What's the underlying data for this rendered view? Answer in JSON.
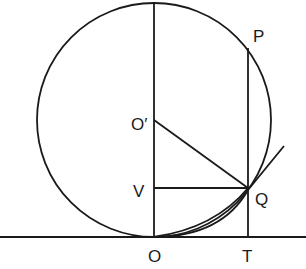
{
  "diagram": {
    "type": "geometry",
    "stroke_color": "#1a1a1a",
    "background": "#ffffff",
    "labels": {
      "P": "P",
      "O_prime": "O′",
      "V": "V",
      "Q": "Q",
      "O": "O",
      "T": "T"
    },
    "points": {
      "O": [
        154,
        237
      ],
      "O_prime": [
        154,
        120
      ],
      "V": [
        154,
        188
      ],
      "Q": [
        248,
        188
      ],
      "P": [
        248,
        48
      ],
      "T": [
        248,
        237
      ]
    },
    "circle": {
      "center": [
        154,
        120
      ],
      "radius": 117
    }
  }
}
